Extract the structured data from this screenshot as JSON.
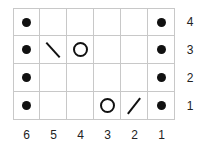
{
  "chart": {
    "rows": 4,
    "cols": 6,
    "row_labels": [
      "4",
      "3",
      "2",
      "1"
    ],
    "col_labels": [
      "6",
      "5",
      "4",
      "3",
      "2",
      "1"
    ],
    "cells": [
      [
        "dot",
        "",
        "",
        "",
        "",
        "dot"
      ],
      [
        "dot",
        "ssk",
        "yo",
        "",
        "",
        "dot"
      ],
      [
        "dot",
        "",
        "",
        "",
        "",
        "dot"
      ],
      [
        "dot",
        "",
        "",
        "yo",
        "k2tog",
        "dot"
      ]
    ]
  },
  "legend_symbols": {
    "dot": "purl",
    "yo": "yarn-over",
    "ssk": "left-slant-decrease",
    "k2tog": "right-slant-decrease"
  }
}
